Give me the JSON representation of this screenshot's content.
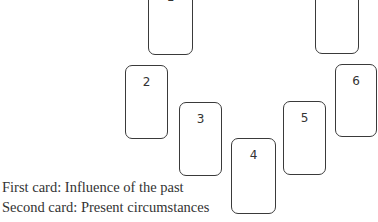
{
  "spread": {
    "cards": [
      {
        "id": "card-1",
        "label": "1"
      },
      {
        "id": "card-7",
        "label": "7"
      },
      {
        "id": "card-2",
        "label": "2"
      },
      {
        "id": "card-3",
        "label": "3"
      },
      {
        "id": "card-4",
        "label": "4"
      },
      {
        "id": "card-5",
        "label": "5"
      },
      {
        "id": "card-6",
        "label": "6"
      }
    ]
  },
  "captions": [
    "First card: Influence of the past",
    "Second card: Present circumstances"
  ]
}
